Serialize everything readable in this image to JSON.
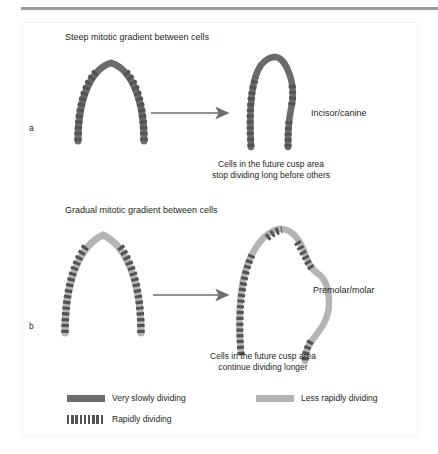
{
  "header": {
    "cropped_line": ""
  },
  "figure": {
    "panels": [
      {
        "key": "a",
        "label": "a",
        "title": "Steep mitotic gradient between cells",
        "tooth_name": "Incisor/canine",
        "caption_line1": "Cells in the future cusp area",
        "caption_line2": "stop dividing long before others",
        "solid_color": "#6b6b6b"
      },
      {
        "key": "b",
        "label": "b",
        "title": "Gradual mitotic gradient between cells",
        "tooth_name": "Premolar/molar",
        "caption_line1": "Cells in the future cusp area",
        "caption_line2": "continue dividing longer",
        "solid_color": "#b4b4b4"
      }
    ]
  },
  "legend": {
    "items": [
      {
        "key": "very-slowly-dividing",
        "label": "Very slowly dividing",
        "swatch": "solid-dark",
        "color": "#6b6b6b"
      },
      {
        "key": "less-rapidly-dividing",
        "label": "Less rapidly dividing",
        "swatch": "solid-light",
        "color": "#b4b4b4"
      },
      {
        "key": "rapidly-dividing",
        "label": "Rapidly dividing",
        "swatch": "striped",
        "color": "#545454"
      }
    ]
  },
  "colors": {
    "dark_gray": "#6b6b6b",
    "light_gray": "#b4b4b4",
    "stripe": "#545454",
    "text": "#231f20",
    "rule": "#9b9b9b"
  }
}
